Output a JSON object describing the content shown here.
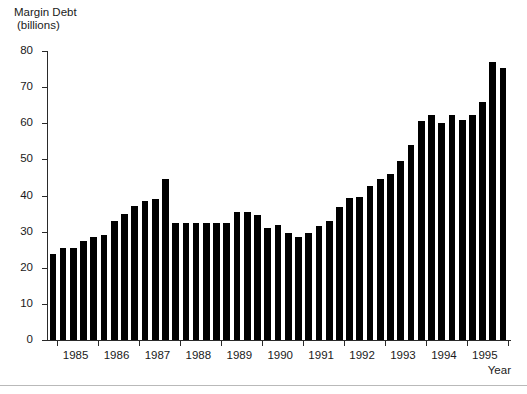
{
  "chart_data": {
    "type": "bar",
    "title": "Margin Debt (billions)",
    "title_line1": "Margin Debt",
    "title_line2": "(billions)",
    "xlabel": "Year",
    "ylabel": "",
    "ylim": [
      0,
      80
    ],
    "ytick_labels": [
      "0",
      "10",
      "20",
      "30",
      "40",
      "50",
      "60",
      "70",
      "80"
    ],
    "ytick_values": [
      0,
      10,
      20,
      30,
      40,
      50,
      60,
      70,
      80
    ],
    "grid": false,
    "legend": false,
    "bar_color": "#000000",
    "categories": [
      "1984 Q4",
      "1985 Q1",
      "1985 Q2",
      "1985 Q3",
      "1985 Q4",
      "1986 Q1",
      "1986 Q2",
      "1986 Q3",
      "1986 Q4",
      "1987 Q1",
      "1987 Q2",
      "1987 Q3",
      "1987 Q4",
      "1988 Q1",
      "1988 Q2",
      "1988 Q3",
      "1988 Q4",
      "1989 Q1",
      "1989 Q2",
      "1989 Q3",
      "1989 Q4",
      "1990 Q1",
      "1990 Q2",
      "1990 Q3",
      "1990 Q4",
      "1991 Q1",
      "1991 Q2",
      "1991 Q3",
      "1991 Q4",
      "1992 Q1",
      "1992 Q2",
      "1992 Q3",
      "1992 Q4",
      "1993 Q1",
      "1993 Q2",
      "1993 Q3",
      "1993 Q4",
      "1994 Q1",
      "1994 Q2",
      "1994 Q3",
      "1994 Q4",
      "1995 Q1",
      "1995 Q2",
      "1995 Q3",
      "1995 Q4"
    ],
    "values": [
      23.8,
      25.5,
      25.5,
      27.5,
      28.5,
      29.0,
      33.0,
      35.0,
      37.0,
      38.5,
      39.0,
      44.5,
      32.5,
      32.5,
      32.5,
      32.5,
      32.5,
      32.5,
      35.3,
      35.3,
      34.7,
      31.0,
      31.7,
      29.5,
      28.5,
      29.5,
      31.5,
      33.0,
      36.8,
      39.3,
      39.6,
      42.5,
      44.5,
      46.0,
      49.5,
      54.0,
      60.7,
      62.2,
      60.0,
      62.2,
      61.0,
      62.3,
      66.0,
      77.0,
      75.3
    ],
    "x_year_labels": [
      "1985",
      "1986",
      "1987",
      "1988",
      "1989",
      "1990",
      "1991",
      "1992",
      "1993",
      "1994",
      "1995"
    ]
  }
}
